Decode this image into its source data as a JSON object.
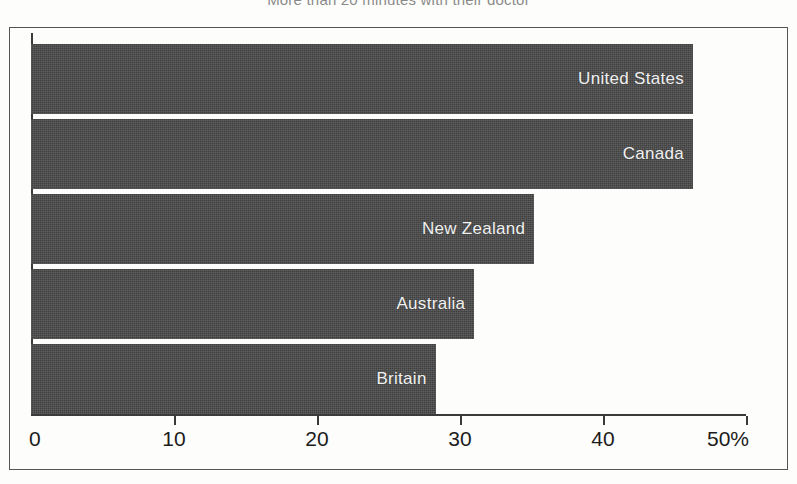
{
  "chart_data": {
    "type": "bar",
    "orientation": "horizontal",
    "title": "More than 20 minutes with their doctor",
    "xlabel": "",
    "ylabel": "",
    "categories": [
      "United States",
      "Canada",
      "New Zealand",
      "Australia",
      "Britain"
    ],
    "values": [
      46.3,
      46.3,
      35.2,
      31.0,
      28.3
    ],
    "unit": "%",
    "xlim": [
      0,
      50
    ],
    "xticks": [
      0,
      10,
      20,
      30,
      40,
      50
    ],
    "xtick_labels": [
      "0",
      "10",
      "20",
      "30",
      "40",
      "50%"
    ],
    "grid": false,
    "legend": false,
    "bar_color": "#474747",
    "label_color": "#f2f2f2",
    "axis_color": "#3a3a3a",
    "background_color": "#fdfdfb"
  },
  "axis": {
    "ticks": [
      {
        "label": "0",
        "value": 0
      },
      {
        "label": "10",
        "value": 10
      },
      {
        "label": "20",
        "value": 20
      },
      {
        "label": "30",
        "value": 30
      },
      {
        "label": "40",
        "value": 40
      },
      {
        "label": "50%",
        "value": 50
      }
    ]
  }
}
